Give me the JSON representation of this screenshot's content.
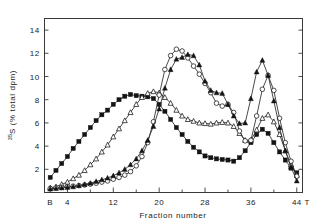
{
  "chart_data": {
    "type": "line",
    "title": "",
    "xlabel": "Fraction number",
    "ylabel": "35S (% total dpm)",
    "ylabel_sup": "35",
    "ylabel_rest": "S (% total dpm)",
    "xlim": [
      0,
      45
    ],
    "ylim": [
      0,
      15
    ],
    "grid": false,
    "legend": "none",
    "x_tick_labels": [
      "B",
      "4",
      "12",
      "20",
      "28",
      "36",
      "44"
    ],
    "x_tick_values": [
      1,
      4,
      12,
      20,
      28,
      36,
      44
    ],
    "x_minor_ticks": [
      8,
      16,
      24,
      32,
      40
    ],
    "x_axis_start_label": "B",
    "x_axis_end_label": "T",
    "y_tick_labels": [
      "2",
      "4",
      "6",
      "8",
      "10",
      "12",
      "14"
    ],
    "y_tick_values": [
      2,
      4,
      6,
      8,
      10,
      12,
      14
    ],
    "series": [
      {
        "name": "filled-squares",
        "marker": "filled-square",
        "x": [
          1,
          2,
          3,
          4,
          5,
          6,
          7,
          8,
          9,
          10,
          11,
          12,
          13,
          14,
          15,
          16,
          17,
          18,
          19,
          20,
          21,
          22,
          23,
          24,
          25,
          26,
          27,
          28,
          29,
          30,
          31,
          32,
          33,
          34,
          35,
          36,
          37,
          38,
          39,
          40,
          41,
          42,
          43,
          44
        ],
        "values": [
          1.3,
          1.9,
          2.5,
          3.1,
          3.8,
          4.4,
          5.0,
          5.6,
          6.2,
          6.7,
          7.1,
          7.6,
          8.0,
          8.3,
          8.45,
          8.35,
          8.3,
          8.25,
          8.1,
          7.6,
          7.0,
          6.3,
          5.6,
          5.0,
          4.4,
          3.9,
          3.5,
          3.15,
          3.0,
          2.9,
          2.85,
          2.8,
          2.7,
          3.0,
          3.6,
          4.3,
          5.0,
          5.45,
          5.1,
          4.3,
          3.5,
          2.8,
          2.1,
          1.7
        ]
      },
      {
        "name": "open-triangles",
        "marker": "open-triangle",
        "x": [
          1,
          2,
          3,
          4,
          5,
          6,
          7,
          8,
          9,
          10,
          11,
          12,
          13,
          14,
          15,
          16,
          17,
          18,
          19,
          20,
          21,
          22,
          23,
          24,
          25,
          26,
          27,
          28,
          29,
          30,
          31,
          32,
          33,
          34,
          35,
          36,
          37,
          38,
          39,
          40,
          41,
          42,
          43,
          44
        ],
        "values": [
          0.4,
          0.5,
          0.7,
          0.9,
          1.2,
          1.5,
          1.9,
          2.4,
          2.9,
          3.5,
          4.1,
          4.8,
          5.5,
          6.2,
          6.9,
          7.6,
          8.2,
          8.55,
          8.7,
          8.6,
          8.2,
          7.7,
          7.1,
          6.6,
          6.3,
          6.15,
          6.0,
          5.95,
          5.9,
          6.0,
          6.05,
          6.0,
          5.7,
          5.1,
          4.5,
          4.5,
          5.4,
          6.4,
          6.7,
          6.1,
          5.0,
          3.6,
          2.4,
          1.5
        ]
      },
      {
        "name": "open-circles",
        "marker": "open-circle",
        "x": [
          1,
          2,
          3,
          4,
          5,
          6,
          7,
          8,
          9,
          10,
          11,
          12,
          13,
          14,
          15,
          16,
          17,
          18,
          19,
          20,
          21,
          22,
          23,
          24,
          25,
          26,
          27,
          28,
          29,
          30,
          31,
          32,
          33,
          34,
          35,
          36,
          37,
          38,
          39,
          40,
          41,
          42,
          43,
          44
        ],
        "values": [
          0.35,
          0.4,
          0.45,
          0.5,
          0.55,
          0.6,
          0.65,
          0.72,
          0.8,
          0.9,
          1.0,
          1.15,
          1.3,
          1.5,
          1.8,
          2.3,
          3.1,
          4.3,
          6.1,
          8.4,
          10.6,
          11.8,
          12.35,
          12.2,
          11.6,
          10.9,
          10.2,
          9.4,
          8.6,
          7.7,
          7.45,
          7.6,
          6.9,
          5.3,
          4.45,
          4.5,
          6.6,
          8.9,
          10.1,
          8.8,
          6.4,
          4.3,
          2.7,
          1.4
        ]
      },
      {
        "name": "filled-triangles",
        "marker": "filled-triangle",
        "x": [
          1,
          2,
          3,
          4,
          5,
          6,
          7,
          8,
          9,
          10,
          11,
          12,
          13,
          14,
          15,
          16,
          17,
          18,
          19,
          20,
          21,
          22,
          23,
          24,
          25,
          26,
          27,
          28,
          29,
          30,
          31,
          32,
          33,
          34,
          35,
          36,
          37,
          38,
          39,
          40,
          41,
          42,
          43,
          44
        ],
        "values": [
          0.3,
          0.35,
          0.4,
          0.45,
          0.5,
          0.6,
          0.7,
          0.8,
          0.95,
          1.1,
          1.25,
          1.45,
          1.7,
          2.0,
          2.4,
          2.9,
          3.6,
          4.5,
          5.7,
          7.2,
          9.0,
          10.6,
          11.5,
          11.65,
          11.9,
          11.8,
          11.0,
          9.6,
          8.8,
          8.6,
          8.55,
          7.6,
          6.6,
          5.95,
          6.0,
          8.1,
          10.4,
          11.4,
          10.1,
          7.9,
          5.6,
          3.6,
          2.2,
          1.0
        ]
      }
    ]
  },
  "axes": {
    "ylabel_prefix": "35",
    "ylabel_main": "S (% total dpm)",
    "xlabel": "Fraction number",
    "left_marker": "B",
    "right_marker": "T"
  }
}
